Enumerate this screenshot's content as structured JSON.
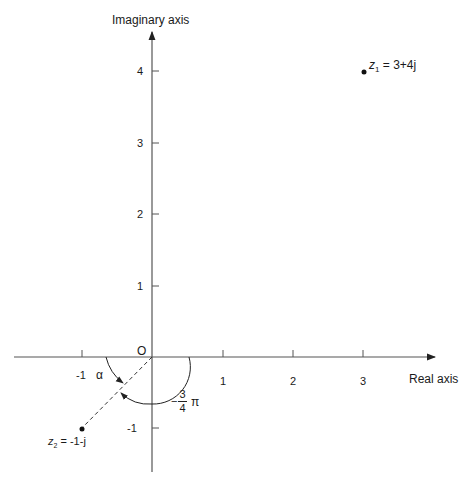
{
  "diagram": {
    "type": "argand_diagram",
    "axes": {
      "x_label": "Real axis",
      "y_label": "Imaginary axis",
      "origin_label": "O",
      "x_ticks": [
        "-1",
        "1",
        "2",
        "3"
      ],
      "y_ticks": [
        "4",
        "3",
        "2",
        "1",
        "-1"
      ]
    },
    "points": [
      {
        "name": "z1",
        "label_var": "z",
        "label_sub": "1",
        "label_rest": " = 3+4j",
        "re": 3,
        "im": 4
      },
      {
        "name": "z2",
        "label_var": "z",
        "label_sub": "2",
        "label_rest": " = -1-j",
        "re": -1,
        "im": -1
      }
    ],
    "angles": {
      "alpha_label": "α",
      "neg_angle_sign": "−",
      "neg_angle_num": "3",
      "neg_angle_den": "4",
      "neg_angle_pi": "π"
    }
  }
}
